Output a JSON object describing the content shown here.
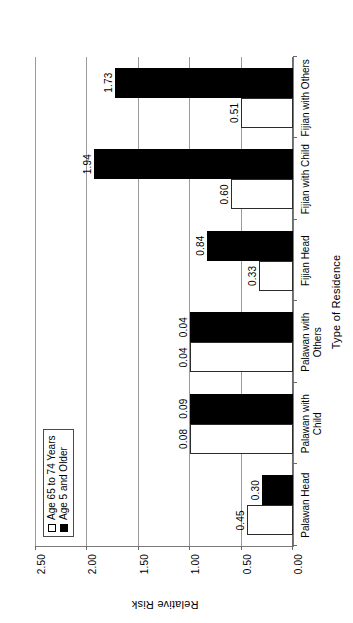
{
  "chart_data": {
    "type": "bar",
    "title": "",
    "xlabel": "Type of Residence",
    "ylabel": "Relative Risk",
    "ylim": [
      0.0,
      2.5
    ],
    "yticks": [
      "0.00",
      "0.50",
      "1.00",
      "1.50",
      "2.00",
      "2.50"
    ],
    "ytick_values": [
      0.0,
      0.5,
      1.0,
      1.5,
      2.0,
      2.5
    ],
    "grid": true,
    "legend_position": "upper-left",
    "orientation": "rotated-90-ccw",
    "categories": [
      "Palawan Head",
      "Palawan with\nChild",
      "Palawan with\nOthers",
      "Fijian Head",
      "Fijian with Child",
      "Fijian with Others"
    ],
    "series": [
      {
        "name": "Age 65 to 74 Years",
        "style": "hollow",
        "color": "#ffffff",
        "edge": "#000000",
        "values": [
          0.45,
          1.0,
          1.0,
          0.33,
          0.6,
          0.51
        ],
        "labels": [
          "0.45",
          "0.08",
          "0.04",
          "0.33",
          "0.60",
          "0.51"
        ]
      },
      {
        "name": "Age 5 and Older",
        "style": "solid",
        "color": "#000000",
        "edge": "#000000",
        "values": [
          0.3,
          1.0,
          1.0,
          0.84,
          1.94,
          1.73
        ],
        "labels": [
          "0.30",
          "0.09",
          "0.04",
          "0.84",
          "1.94",
          "1.73"
        ]
      }
    ]
  },
  "legend": {
    "items": [
      {
        "label": "Age 65 to 74 Years",
        "swatch": "hollow"
      },
      {
        "label": "Age 5 and Older",
        "swatch": "solid"
      }
    ]
  },
  "axes": {
    "y_title": "Relative Risk",
    "x_title": "Type of Residence",
    "y_tick_labels": [
      "2.50",
      "2.00",
      "1.50",
      "1.00",
      "0.50",
      "0.00"
    ]
  }
}
